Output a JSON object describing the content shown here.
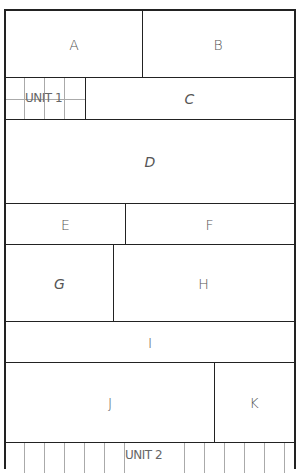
{
  "title": "",
  "rooms": {
    "A": "A",
    "B": "B",
    "C": "C",
    "D": "D",
    "E": "E",
    "F": "F",
    "G": "G",
    "H": "H",
    "I": "I",
    "J": "J",
    "K": "K"
  },
  "units": {
    "unit1": "UNIT 1",
    "unit2": "UNIT 2"
  }
}
